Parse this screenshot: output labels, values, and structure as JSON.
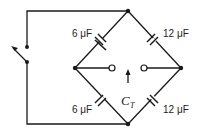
{
  "diagram": {
    "type": "capacitor bridge circuit",
    "capacitors": [
      {
        "position": "top-left",
        "label": "6 μF"
      },
      {
        "position": "top-right",
        "label": "12 μF"
      },
      {
        "position": "bottom-left",
        "label": "6 μF"
      },
      {
        "position": "bottom-right",
        "label": "12 μF"
      }
    ],
    "terminal_label": {
      "main": "C",
      "sub": "T"
    },
    "switch": "open switch on left branch",
    "colors": {
      "wire": "#1a1a1a",
      "background": "#ffffff"
    }
  }
}
